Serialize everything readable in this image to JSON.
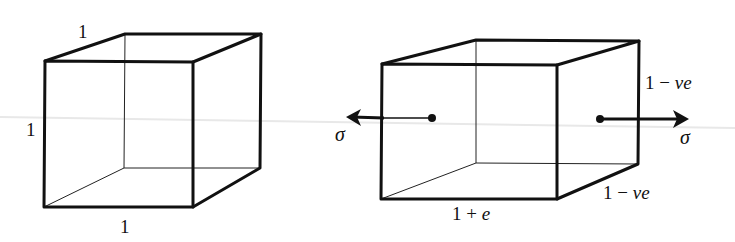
{
  "figure": {
    "colors": {
      "line": "#111111",
      "background": "#ffffff"
    }
  },
  "left_cube": {
    "label_top": "1",
    "label_left": "1",
    "label_bottom": "1"
  },
  "right_cube": {
    "label_length": "1 + e",
    "label_height": "1 − νe",
    "label_depth": "1 − νe",
    "stress_left": "σ",
    "stress_right": "σ"
  }
}
